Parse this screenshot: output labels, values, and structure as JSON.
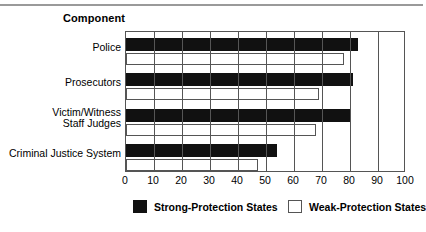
{
  "chart_data": {
    "type": "bar",
    "orientation": "horizontal",
    "title": "",
    "xlabel": "",
    "ylabel": "Component",
    "xlim": [
      0,
      100
    ],
    "xticks": [
      0,
      10,
      20,
      30,
      40,
      50,
      60,
      70,
      80,
      90,
      100
    ],
    "grid": true,
    "legend_position": "bottom",
    "categories": [
      "Police",
      "Prosecutors",
      "Victim/Witness\nStaff Judges",
      "Criminal Justice System"
    ],
    "series": [
      {
        "name": "Strong-Protection States",
        "color": "#111111",
        "values": [
          83,
          81,
          80,
          54
        ]
      },
      {
        "name": "Weak-Protection States",
        "color": "#ffffff",
        "values": [
          78,
          69,
          68,
          47
        ]
      }
    ]
  },
  "legend": {
    "items": [
      {
        "label": "Strong-Protection States",
        "swatch": "black"
      },
      {
        "label": "Weak-Protection States",
        "swatch": "white"
      }
    ]
  }
}
